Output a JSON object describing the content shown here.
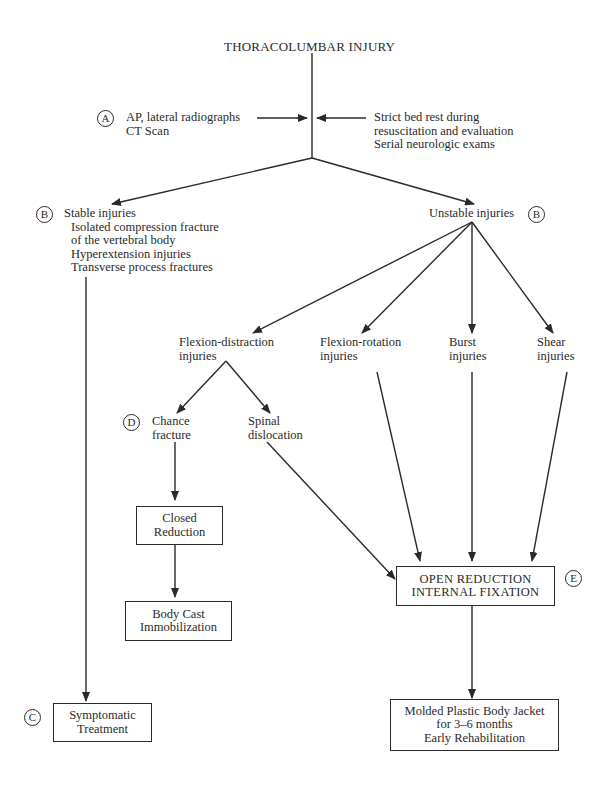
{
  "title": "THORACOLUMBAR INJURY",
  "step_a": {
    "marker": "A",
    "left_lines": [
      "AP, lateral radiographs",
      "CT Scan"
    ],
    "right_lines": [
      "Strict bed rest during",
      "resuscitation and evaluation",
      "Serial neurologic exams"
    ]
  },
  "stable": {
    "marker": "B",
    "heading": "Stable injuries",
    "items": [
      "Isolated compression fracture",
      "of the vertebral body",
      "Hyperextension injuries",
      "Transverse process fractures"
    ]
  },
  "unstable": {
    "marker": "B",
    "heading": "Unstable injuries",
    "types": [
      {
        "line1": "Flexion-distraction",
        "line2": "injuries"
      },
      {
        "line1": "Flexion-rotation",
        "line2": "injuries"
      },
      {
        "line1": "Burst",
        "line2": "injuries"
      },
      {
        "line1": "Shear",
        "line2": "injuries"
      }
    ]
  },
  "flexion_distraction": {
    "chance": {
      "marker": "D",
      "line1": "Chance",
      "line2": "fracture"
    },
    "spinal": {
      "line1": "Spinal",
      "line2": "dislocation"
    }
  },
  "boxes": {
    "closed_reduction": [
      "Closed",
      "Reduction"
    ],
    "body_cast": [
      "Body Cast",
      "Immobilization"
    ],
    "orif": {
      "marker": "E",
      "lines": [
        "OPEN REDUCTION",
        "INTERNAL FIXATION"
      ]
    },
    "symptomatic": {
      "marker": "C",
      "lines": [
        "Symptomatic",
        "Treatment"
      ]
    },
    "jacket": [
      "Molded Plastic Body Jacket",
      "for 3–6 months",
      "Early Rehabilitation"
    ]
  }
}
